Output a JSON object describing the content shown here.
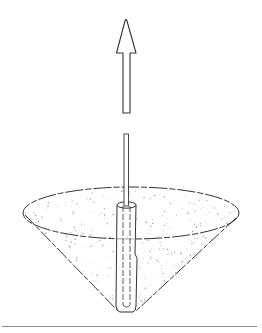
{
  "figure": {
    "description": "Patent-style line drawing: a cone filled with stippled granular material, a hollow tube inserted vertically through the center, a thin rod inside the tube extending upward, and an upward-pointing arrow above indicating upward withdrawal",
    "colors": {
      "line": "#333333",
      "stipple": "#9a9a9a",
      "baseline": "#8c8c8c",
      "background": "#ffffff"
    },
    "elements": {
      "arrow": {
        "direction": "up"
      },
      "rod": {
        "label": ""
      },
      "tube": {
        "label": ""
      },
      "cone": {
        "fill": "stippled"
      },
      "baseline": {
        "style": "solid"
      }
    }
  }
}
